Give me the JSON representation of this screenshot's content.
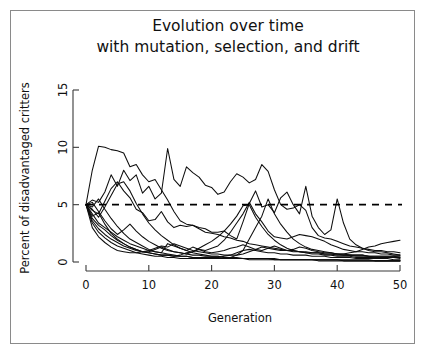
{
  "figure": {
    "background_color": "#ffffff",
    "frame_color": "#8a8a8a",
    "line_color": "#0d0d0d"
  },
  "chart_data": {
    "type": "line",
    "title": "Evolution over time with mutation, selection, and drift",
    "title_lines": [
      "Evolution over time",
      "with mutation, selection, and drift"
    ],
    "xlabel": "Generation",
    "ylabel": "Percent of disadvantaged critters",
    "xlim": [
      0,
      50
    ],
    "ylim": [
      0,
      15
    ],
    "xticks": [
      0,
      10,
      20,
      30,
      40,
      50
    ],
    "yticks": [
      0,
      5,
      10,
      15
    ],
    "xtick_labels": [
      "0",
      "10",
      "20",
      "30",
      "40",
      "50"
    ],
    "ytick_labels": [
      "0",
      "5",
      "10",
      "15"
    ],
    "grid": false,
    "legend": "none",
    "annotations": [
      {
        "type": "horizontal-reference-line",
        "y": 5,
        "style": "dashed",
        "label": ""
      }
    ],
    "x": [
      0,
      1,
      2,
      3,
      4,
      5,
      6,
      7,
      8,
      9,
      10,
      11,
      12,
      13,
      14,
      15,
      16,
      17,
      18,
      19,
      20,
      21,
      22,
      23,
      24,
      25,
      26,
      27,
      28,
      29,
      30,
      31,
      32,
      33,
      34,
      35,
      36,
      37,
      38,
      39,
      40,
      41,
      42,
      43,
      44,
      45,
      46,
      47,
      48,
      49,
      50
    ],
    "series": [
      {
        "name": "run-1",
        "values": [
          5.0,
          8.0,
          10.1,
          10.0,
          9.8,
          9.7,
          9.5,
          8.3,
          8.5,
          7.6,
          7.0,
          7.2,
          6.3,
          5.4,
          4.4,
          3.6,
          3.3,
          3.2,
          2.9,
          2.6,
          2.5,
          2.4,
          2.2,
          2.1,
          1.9,
          1.8,
          1.6,
          1.5,
          1.4,
          1.3,
          1.2,
          1.1,
          1.0,
          1.0,
          0.9,
          0.9,
          0.8,
          0.8,
          0.7,
          0.7,
          0.6,
          0.6,
          0.6,
          0.5,
          0.5,
          0.5,
          0.4,
          0.4,
          0.4,
          0.4,
          0.3
        ]
      },
      {
        "name": "run-2",
        "values": [
          5.0,
          5.4,
          5.2,
          6.1,
          7.6,
          6.6,
          8.0,
          7.1,
          7.6,
          6.0,
          6.6,
          5.5,
          6.0,
          9.9,
          7.2,
          6.6,
          8.3,
          7.8,
          7.4,
          6.7,
          6.5,
          5.9,
          6.1,
          7.0,
          7.7,
          7.4,
          6.9,
          7.2,
          8.5,
          7.9,
          6.3,
          5.0,
          4.6,
          4.7,
          5.0,
          4.5,
          3.0,
          2.3,
          2.1,
          2.0,
          1.8,
          1.6,
          1.4,
          1.3,
          1.2,
          1.1,
          1.0,
          1.0,
          0.9,
          0.9,
          0.8
        ]
      },
      {
        "name": "run-3",
        "values": [
          5.0,
          4.5,
          4.2,
          5.3,
          6.4,
          7.0,
          6.2,
          5.6,
          4.6,
          4.3,
          3.6,
          3.7,
          4.4,
          3.5,
          3.0,
          3.2,
          3.1,
          3.2,
          3.0,
          2.9,
          2.6,
          2.6,
          2.7,
          2.3,
          2.0,
          3.5,
          5.1,
          6.2,
          4.8,
          5.0,
          4.3,
          5.6,
          6.1,
          5.0,
          4.2,
          6.6,
          4.0,
          3.0,
          2.4,
          2.8,
          5.5,
          3.4,
          2.0,
          1.5,
          1.2,
          1.0,
          0.9,
          0.9,
          0.8,
          0.7,
          0.6
        ]
      },
      {
        "name": "run-4",
        "values": [
          5.0,
          4.2,
          3.4,
          3.0,
          2.6,
          2.2,
          1.9,
          1.6,
          1.4,
          1.2,
          1.0,
          0.9,
          0.8,
          1.6,
          1.4,
          1.2,
          1.0,
          1.3,
          1.1,
          1.0,
          1.2,
          1.4,
          1.9,
          2.6,
          3.4,
          4.2,
          5.2,
          4.2,
          3.5,
          2.7,
          2.2,
          2.1,
          2.0,
          2.2,
          2.4,
          2.3,
          2.2,
          2.0,
          1.8,
          1.5,
          1.3,
          1.1,
          1.0,
          0.9,
          0.9,
          0.8,
          0.8,
          0.7,
          0.7,
          0.6,
          0.6
        ]
      },
      {
        "name": "run-5",
        "values": [
          5.0,
          3.8,
          3.2,
          2.8,
          2.3,
          1.9,
          1.6,
          1.3,
          1.1,
          0.9,
          0.8,
          0.7,
          0.6,
          0.6,
          0.5,
          0.6,
          0.8,
          0.9,
          1.1,
          0.9,
          0.8,
          0.9,
          1.0,
          1.2,
          1.3,
          1.5,
          1.3,
          1.1,
          1.0,
          1.2,
          1.4,
          1.2,
          1.0,
          1.1,
          1.3,
          1.2,
          1.0,
          0.9,
          0.8,
          0.8,
          0.7,
          0.7,
          0.8,
          0.9,
          1.1,
          1.3,
          1.4,
          1.6,
          1.7,
          1.8,
          1.9
        ]
      },
      {
        "name": "run-6",
        "values": [
          5.0,
          3.4,
          2.6,
          2.1,
          1.7,
          1.4,
          1.2,
          1.0,
          0.8,
          0.7,
          0.6,
          0.5,
          0.5,
          0.4,
          0.4,
          0.3,
          0.3,
          0.3,
          0.3,
          0.3,
          0.3,
          0.4,
          0.5,
          0.6,
          0.8,
          1.0,
          1.1,
          1.0,
          0.9,
          0.8,
          0.8,
          0.7,
          0.7,
          0.6,
          0.6,
          0.6,
          0.5,
          0.5,
          0.5,
          0.4,
          0.4,
          0.4,
          0.4,
          0.3,
          0.3,
          0.3,
          0.3,
          0.3,
          0.3,
          0.2,
          0.2
        ]
      },
      {
        "name": "run-7",
        "values": [
          5.0,
          3.0,
          2.2,
          1.7,
          1.3,
          1.0,
          0.9,
          0.8,
          0.8,
          0.9,
          1.0,
          1.2,
          1.4,
          1.3,
          1.6,
          1.4,
          1.2,
          1.0,
          0.9,
          0.8,
          0.7,
          0.7,
          0.6,
          0.6,
          0.6,
          0.7,
          0.9,
          1.1,
          1.3,
          1.2,
          1.1,
          1.0,
          1.0,
          0.9,
          0.9,
          0.8,
          0.8,
          0.8,
          0.7,
          0.7,
          0.7,
          0.6,
          0.6,
          0.6,
          0.6,
          0.5,
          0.5,
          0.5,
          0.5,
          0.5,
          0.4
        ]
      },
      {
        "name": "run-8",
        "values": [
          5.0,
          4.0,
          4.3,
          3.3,
          2.5,
          2.0,
          1.6,
          1.3,
          1.1,
          0.9,
          0.8,
          0.7,
          0.6,
          0.6,
          0.5,
          0.5,
          0.5,
          0.4,
          0.4,
          0.4,
          0.4,
          0.4,
          0.3,
          0.3,
          0.3,
          0.3,
          0.3,
          0.3,
          0.3,
          0.3,
          0.2,
          0.2,
          0.2,
          0.2,
          0.2,
          0.2,
          0.2,
          0.2,
          0.2,
          0.2,
          0.2,
          0.1,
          0.1,
          0.1,
          0.1,
          0.1,
          0.1,
          0.1,
          0.1,
          0.1,
          0.1
        ]
      },
      {
        "name": "run-9",
        "values": [
          5.0,
          4.8,
          5.5,
          4.6,
          3.8,
          3.1,
          2.5,
          2.0,
          1.7,
          1.4,
          1.1,
          0.9,
          0.8,
          0.7,
          0.6,
          0.5,
          0.5,
          0.4,
          0.4,
          0.4,
          0.3,
          0.3,
          0.3,
          0.3,
          0.3,
          0.3,
          0.2,
          0.2,
          0.2,
          0.2,
          0.2,
          0.2,
          0.2,
          0.2,
          0.2,
          0.2,
          0.2,
          0.1,
          0.1,
          0.1,
          0.1,
          0.1,
          0.1,
          0.1,
          0.1,
          0.1,
          0.1,
          0.1,
          0.1,
          0.1,
          0.1
        ]
      },
      {
        "name": "run-10",
        "values": [
          5.0,
          4.6,
          3.9,
          4.8,
          5.8,
          6.8,
          7.0,
          6.2,
          5.1,
          4.2,
          3.4,
          2.8,
          2.3,
          1.9,
          1.5,
          1.2,
          1.0,
          0.8,
          0.7,
          0.6,
          0.5,
          0.5,
          0.4,
          0.4,
          0.4,
          0.3,
          0.3,
          0.3,
          0.3,
          0.3,
          0.3,
          0.2,
          0.2,
          0.2,
          0.2,
          0.2,
          0.2,
          0.2,
          0.2,
          0.2,
          0.2,
          0.2,
          0.2,
          0.2,
          0.2,
          0.2,
          0.1,
          0.1,
          0.1,
          0.1,
          0.1
        ]
      },
      {
        "name": "run-11",
        "values": [
          5.0,
          5.2,
          4.4,
          3.6,
          2.9,
          2.4,
          2.8,
          3.3,
          2.7,
          2.2,
          1.8,
          1.5,
          1.2,
          1.0,
          0.9,
          0.8,
          0.7,
          0.9,
          1.2,
          1.5,
          1.8,
          2.2,
          2.7,
          3.3,
          4.0,
          4.9,
          5.0,
          3.9,
          3.1,
          2.4,
          1.9,
          1.5,
          1.2,
          1.0,
          0.9,
          0.8,
          0.7,
          0.7,
          0.6,
          0.6,
          0.5,
          0.5,
          0.5,
          0.4,
          0.4,
          0.4,
          0.4,
          0.4,
          0.4,
          0.4,
          0.4
        ]
      },
      {
        "name": "run-12",
        "values": [
          5.0,
          3.6,
          2.9,
          2.4,
          2.0,
          1.7,
          1.4,
          1.2,
          1.0,
          0.9,
          0.9,
          1.1,
          1.3,
          1.1,
          0.9,
          0.8,
          0.7,
          0.6,
          0.6,
          0.5,
          0.5,
          0.5,
          0.4,
          0.4,
          0.6,
          1.0,
          2.0,
          3.0,
          4.0,
          5.5,
          4.2,
          3.3,
          2.6,
          2.0,
          1.6,
          1.3,
          1.1,
          1.0,
          0.9,
          0.8,
          0.7,
          0.7,
          0.6,
          0.6,
          0.6,
          0.5,
          0.5,
          0.5,
          0.5,
          0.5,
          0.5
        ]
      }
    ]
  }
}
